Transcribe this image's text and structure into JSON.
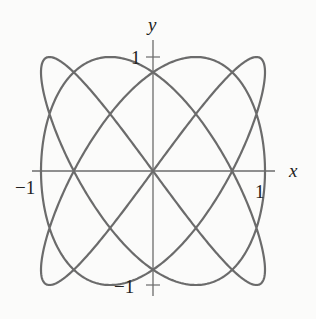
{
  "chart_data": {
    "type": "line",
    "title": "",
    "parametric": {
      "x": "sin(3t)",
      "y": "sin(4t)",
      "t_range": [
        0,
        6.283185
      ]
    },
    "xlabel": "x",
    "ylabel": "y",
    "xlim": [
      -1.1,
      1.1
    ],
    "ylim": [
      -1.1,
      1.1
    ],
    "x_ticks": [
      {
        "value": -1,
        "label": "−1"
      },
      {
        "value": 1,
        "label": "1"
      }
    ],
    "y_ticks": [
      {
        "value": 1,
        "label": "1"
      },
      {
        "value": -1,
        "label": "−1"
      }
    ],
    "grid": false,
    "legend": null,
    "curve_color": "#6b6b6b",
    "axis_color": "#6b6b6b"
  },
  "labels": {
    "x": "x",
    "y": "y",
    "x_neg": "−1",
    "x_pos": "1",
    "y_pos": "1",
    "y_neg": "−1"
  }
}
